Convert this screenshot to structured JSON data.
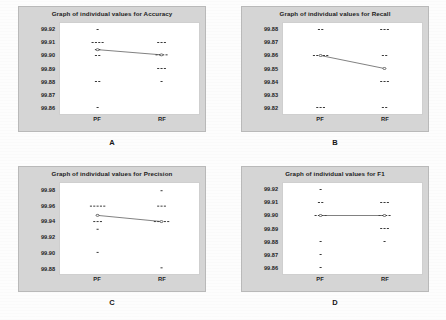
{
  "figure": {
    "panel_letters": [
      "A",
      "B",
      "C",
      "D"
    ],
    "group_labels": [
      "PF",
      "RF"
    ],
    "dot_color": "#3a3a3a",
    "line_color": "#4a4a4a",
    "panel_bg": "#d5d5d5",
    "plot_bg": "#ffffff"
  },
  "chart_data": [
    {
      "type": "scatter",
      "panel": "A",
      "title": "Graph of individual values for Accuracy",
      "xlabel": "",
      "ylabel": "",
      "categories": [
        "PF",
        "RF"
      ],
      "ylim": [
        99.855,
        99.925
      ],
      "yticks": [
        "99.92",
        "99.91",
        "99.90",
        "99.89",
        "99.88",
        "99.87",
        "99.86"
      ],
      "ytick_values": [
        99.92,
        99.91,
        99.9,
        99.89,
        99.88,
        99.87,
        99.86
      ],
      "grid": false,
      "legend": "none",
      "series": [
        {
          "name": "PF",
          "values": [
            99.92,
            99.91,
            99.91,
            99.91,
            99.91,
            99.9045,
            99.9045,
            99.9,
            99.9,
            99.88,
            99.88,
            99.86
          ],
          "mean": 99.9045
        },
        {
          "name": "RF",
          "values": [
            99.91,
            99.91,
            99.91,
            99.9005,
            99.9005,
            99.9005,
            99.9005,
            99.89,
            99.89,
            99.89,
            99.88
          ],
          "mean": 99.9005
        }
      ],
      "mean_connector": [
        99.9045,
        99.9005
      ]
    },
    {
      "type": "scatter",
      "panel": "B",
      "title": "Graph of individual values for Recall",
      "xlabel": "",
      "ylabel": "",
      "categories": [
        "PF",
        "RF"
      ],
      "ylim": [
        99.815,
        99.885
      ],
      "yticks": [
        "99.88",
        "99.87",
        "99.86",
        "99.85",
        "99.84",
        "99.83",
        "99.82"
      ],
      "ytick_values": [
        99.88,
        99.87,
        99.86,
        99.85,
        99.84,
        99.83,
        99.82
      ],
      "grid": false,
      "legend": "none",
      "series": [
        {
          "name": "PF",
          "values": [
            99.88,
            99.88,
            99.86,
            99.86,
            99.86,
            99.86,
            99.86,
            99.82,
            99.82,
            99.82
          ],
          "mean": 99.86
        },
        {
          "name": "RF",
          "values": [
            99.88,
            99.88,
            99.88,
            99.86,
            99.86,
            99.85,
            99.84,
            99.84,
            99.84,
            99.82,
            99.82
          ],
          "mean": 99.85
        }
      ],
      "mean_connector": [
        99.86,
        99.85
      ]
    },
    {
      "type": "scatter",
      "panel": "C",
      "title": "Graph of individual values for Precision",
      "xlabel": "",
      "ylabel": "",
      "categories": [
        "PF",
        "RF"
      ],
      "ylim": [
        99.872,
        99.99
      ],
      "yticks": [
        "99.98",
        "99.96",
        "99.94",
        "99.92",
        "99.90",
        "99.88"
      ],
      "ytick_values": [
        99.98,
        99.96,
        99.94,
        99.92,
        99.9,
        99.88
      ],
      "grid": false,
      "legend": "none",
      "series": [
        {
          "name": "PF",
          "values": [
            99.96,
            99.96,
            99.96,
            99.96,
            99.96,
            99.948,
            99.94,
            99.94,
            99.94,
            99.93,
            99.9
          ],
          "mean": 99.948
        },
        {
          "name": "RF",
          "values": [
            99.98,
            99.96,
            99.96,
            99.96,
            99.94,
            99.94,
            99.94,
            99.94,
            99.94,
            99.88
          ],
          "mean": 99.94
        }
      ],
      "mean_connector": [
        99.948,
        99.94
      ]
    },
    {
      "type": "scatter",
      "panel": "D",
      "title": "Graph of individual values for F1",
      "xlabel": "",
      "ylabel": "",
      "categories": [
        "PF",
        "RF"
      ],
      "ylim": [
        99.855,
        99.925
      ],
      "yticks": [
        "99.92",
        "99.91",
        "99.90",
        "99.89",
        "99.88",
        "99.87",
        "99.86"
      ],
      "ytick_values": [
        99.92,
        99.91,
        99.9,
        99.89,
        99.88,
        99.87,
        99.86
      ],
      "grid": false,
      "legend": "none",
      "series": [
        {
          "name": "PF",
          "values": [
            99.92,
            99.91,
            99.91,
            99.9,
            99.9,
            99.9,
            99.9,
            99.88,
            99.87,
            99.86
          ],
          "mean": 99.9
        },
        {
          "name": "RF",
          "values": [
            99.91,
            99.91,
            99.91,
            99.9,
            99.9,
            99.9,
            99.9,
            99.89,
            99.89,
            99.89,
            99.88
          ],
          "mean": 99.9
        }
      ],
      "mean_connector": [
        99.9,
        99.9
      ]
    }
  ]
}
